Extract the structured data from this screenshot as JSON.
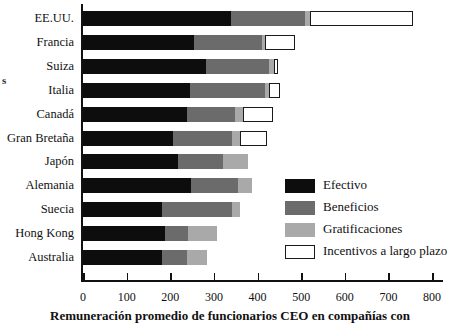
{
  "axis_fragment": "s",
  "caption": "Remuneración promedio de funcionarios CEO en compañías con",
  "legend": {
    "items": [
      {
        "key": "efectivo",
        "label": "Efectivo",
        "color": "#0d0d0d"
      },
      {
        "key": "beneficios",
        "label": "Beneficios",
        "color": "#6b6b6b"
      },
      {
        "key": "gratificaciones",
        "label": "Gratificaciones",
        "color": "#a9a9a9"
      },
      {
        "key": "incentivos",
        "label": "Incentivos a largo plazo",
        "color": "#ffffff"
      }
    ]
  },
  "chart_data": {
    "type": "bar",
    "orientation": "horizontal",
    "stacked": true,
    "title": "",
    "xlabel": "Remuneración promedio de funcionarios CEO en compañías con",
    "ylabel": "s",
    "xlim": [
      0,
      800
    ],
    "xticks": [
      0,
      100,
      200,
      300,
      400,
      500,
      600,
      700,
      800
    ],
    "xticklabels": [
      "0",
      "100",
      "200",
      "300",
      "400",
      "500",
      "600",
      "700",
      "800"
    ],
    "grid": false,
    "legend_position": "inside-right",
    "categories": [
      "EE.UU.",
      "Francia",
      "Suiza",
      "Italia",
      "Canadá",
      "Gran Bretaña",
      "Japón",
      "Alemania",
      "Suecia",
      "Hong Kong",
      "Australia"
    ],
    "series": [
      {
        "name": "Efectivo",
        "color": "#0d0d0d",
        "values": [
          340,
          255,
          282,
          245,
          239,
          206,
          218,
          248,
          181,
          188,
          181
        ]
      },
      {
        "name": "Beneficios",
        "color": "#6b6b6b",
        "values": [
          169,
          155,
          145,
          172,
          110,
          136,
          103,
          107,
          161,
          53,
          58
        ]
      },
      {
        "name": "Gratificaciones",
        "color": "#a9a9a9",
        "values": [
          12,
          8,
          10,
          9,
          18,
          18,
          57,
          33,
          18,
          66,
          45
        ]
      },
      {
        "name": "Incentivos a largo plazo",
        "color": "#ffffff",
        "values": [
          236,
          68,
          10,
          26,
          69,
          62,
          0,
          0,
          0,
          0,
          0
        ]
      }
    ],
    "totals": [
      757,
      486,
      447,
      452,
      436,
      422,
      378,
      388,
      360,
      307,
      284
    ]
  }
}
